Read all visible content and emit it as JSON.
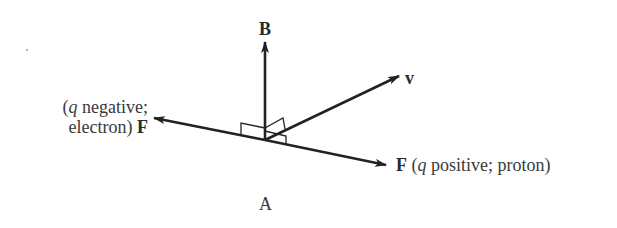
{
  "diagram": {
    "panel_label": "A",
    "vectors": {
      "B": {
        "label": "B"
      },
      "v": {
        "label": "v"
      },
      "F_negative": {
        "symbol": "F",
        "open": "(",
        "charge_symbol": "q",
        "line1_rest": " negative;",
        "line2_prefix": "electron) "
      },
      "F_positive": {
        "symbol": "F",
        "open": " (",
        "charge_symbol": "q",
        "rest": " positive; proton)"
      }
    },
    "colors": {
      "line": "#222222",
      "text": "#3a3a3a"
    }
  }
}
